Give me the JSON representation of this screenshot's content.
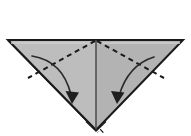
{
  "figure": {
    "kind": "origami-fold-diagram",
    "title": "",
    "caption": "",
    "canvas": {
      "width": 191,
      "height": 136,
      "background": "#ffffff"
    }
  },
  "colors": {
    "paper_fill": "#b6b6b6",
    "paper_fill_light": "#c3c3c3",
    "paper_fill_shadow": "#a8a8a8",
    "outline": "#1a1a1a",
    "fold_line": "#1a1a1a",
    "arrow": "#2b2b2b",
    "layer_gap": "#ffffff",
    "background": "#ffffff"
  },
  "shapes": {
    "paper_triangle": {
      "name": "downward-triangle-paper",
      "points": "8,40 183,40 96,130",
      "fill": "#b6b6b6",
      "stroke": "#1a1a1a",
      "stroke_width": 2
    },
    "left_half": {
      "name": "left-half-panel",
      "points": "8,40 96,40 96,130",
      "fill": "#bcbcbc"
    },
    "right_half": {
      "name": "right-half-panel",
      "points": "96,40 183,40 96,130",
      "fill": "#b2b2b2"
    },
    "top_edge": {
      "name": "top-raw-edge",
      "x1": 8,
      "y1": 40,
      "x2": 183,
      "y2": 40,
      "stroke_width": 2
    },
    "center_line": {
      "name": "vertical-center-crease",
      "x1": 96,
      "y1": 40,
      "x2": 96,
      "y2": 130,
      "style": "solid",
      "stroke_width": 1.4
    }
  },
  "fold_lines": [
    {
      "name": "valley-fold-left",
      "style": "dashed",
      "dash": "5 4",
      "x1": 96,
      "y1": 41,
      "x2": 28,
      "y2": 78,
      "stroke_width": 1.8
    },
    {
      "name": "valley-fold-right",
      "style": "dashed",
      "dash": "5 4",
      "x1": 96,
      "y1": 41,
      "x2": 164,
      "y2": 78,
      "stroke_width": 1.8
    }
  ],
  "arrows": [
    {
      "name": "fold-arrow-left",
      "path": "M32,56 Q62,62 72,98",
      "head_points": "72,103 66,92 79,93",
      "direction": "down-right",
      "stroke_width": 1.6
    },
    {
      "name": "fold-arrow-right",
      "path": "M154,57 Q128,66 118,99",
      "head_points": "117,103 111,92 124,93",
      "direction": "down-left",
      "stroke_width": 1.6
    }
  ],
  "layer_edges": [
    {
      "name": "layer-edge-outer-left",
      "path": "M8,40 L96,130",
      "stroke": "#1a1a1a",
      "stroke_width": 2
    },
    {
      "name": "layer-gap-left-1",
      "path": "M12,41 L98,130",
      "stroke": "#ffffff",
      "stroke_width": 2
    },
    {
      "name": "layer-edge-mid-left",
      "path": "M15,42 L100,130",
      "stroke": "#1a1a1a",
      "stroke_width": 1.6
    },
    {
      "name": "layer-gap-left-2",
      "path": "M19,43 L102,131",
      "stroke": "#ffffff",
      "stroke_width": 1.8
    },
    {
      "name": "layer-edge-inner-left",
      "path": "M22,44 L103,132",
      "stroke": "#1a1a1a",
      "stroke_width": 1.4
    },
    {
      "name": "layer-edge-right",
      "path": "M183,40 L96,130",
      "stroke": "#1a1a1a",
      "stroke_width": 2
    }
  ]
}
